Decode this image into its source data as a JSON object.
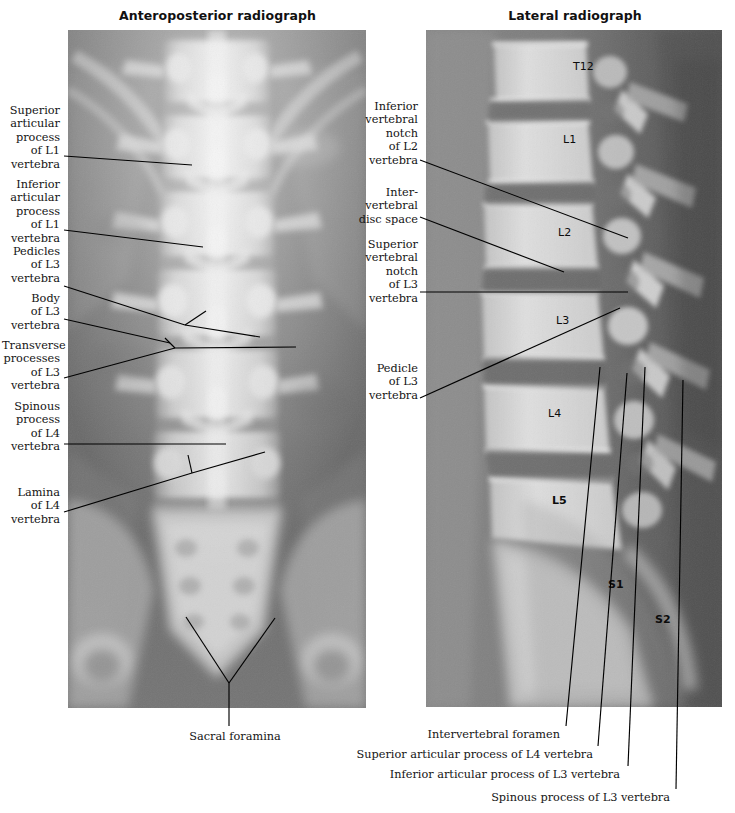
{
  "figure": {
    "panels": [
      {
        "key": "ap",
        "title": "Anteroposterior radiograph"
      },
      {
        "key": "lat",
        "title": "Lateral radiograph"
      }
    ]
  },
  "ap_panel": {
    "title": "Anteroposterior radiograph",
    "labels": [
      {
        "id": "superior-articular-process-l1",
        "text": "Superior\narticular\nprocess\nof L1\nvertebra"
      },
      {
        "id": "inferior-articular-process-l1",
        "text": "Inferior\narticular\nprocess\nof L1\nvertebra"
      },
      {
        "id": "pedicles-l3",
        "text": "Pedicles\nof L3\nvertebra"
      },
      {
        "id": "body-l3",
        "text": "Body\nof L3\nvertebra"
      },
      {
        "id": "transverse-processes-l3",
        "text": "Transverse\nprocesses\nof L3\nvertebra"
      },
      {
        "id": "spinous-process-l4",
        "text": "Spinous\nprocess\nof L4\nvertebra"
      },
      {
        "id": "lamina-l4",
        "text": "Lamina\nof L4\nvertebra"
      },
      {
        "id": "sacral-foramina",
        "text": "Sacral foramina"
      }
    ]
  },
  "lat_panel": {
    "title": "Lateral radiograph",
    "labels": [
      {
        "id": "inferior-vertebral-notch-l2",
        "text": "Inferior\nvertebral\nnotch\nof L2\nvertebra"
      },
      {
        "id": "intervertebral-disc-space",
        "text": "Inter-\nvertebral\ndisc space"
      },
      {
        "id": "superior-vertebral-notch-l3",
        "text": "Superior\nvertebral\nnotch\nof L3\nvertebra"
      },
      {
        "id": "pedicle-l3",
        "text": "Pedicle\nof L3\nvertebra"
      },
      {
        "id": "intervertebral-foramen",
        "text": "Intervertebral foramen"
      },
      {
        "id": "superior-articular-process-l4",
        "text": "Superior articular process of L4 vertebra"
      },
      {
        "id": "inferior-articular-process-l3",
        "text": "Inferior articular process of L3 vertebra"
      },
      {
        "id": "spinous-process-l3",
        "text": "Spinous process of L3 vertebra"
      }
    ],
    "vertebra_marks": [
      {
        "id": "t12",
        "text": "T12",
        "bold": false
      },
      {
        "id": "l1",
        "text": "L1",
        "bold": false
      },
      {
        "id": "l2",
        "text": "L2",
        "bold": false
      },
      {
        "id": "l3",
        "text": "L3",
        "bold": false
      },
      {
        "id": "l4",
        "text": "L4",
        "bold": false
      },
      {
        "id": "l5",
        "text": "L5",
        "bold": true
      },
      {
        "id": "s1",
        "text": "S1",
        "bold": true
      },
      {
        "id": "s2",
        "text": "S2",
        "bold": true
      }
    ]
  },
  "colors": {
    "page_background": "#ffffff",
    "text": "#141414",
    "leader_line": "#000000",
    "film_soft_tissue": "#6f6f6f",
    "film_bone_bright": "#d8d8d8",
    "film_bone_white": "#f1f1f1",
    "film_dark": "#4a4a4a"
  }
}
